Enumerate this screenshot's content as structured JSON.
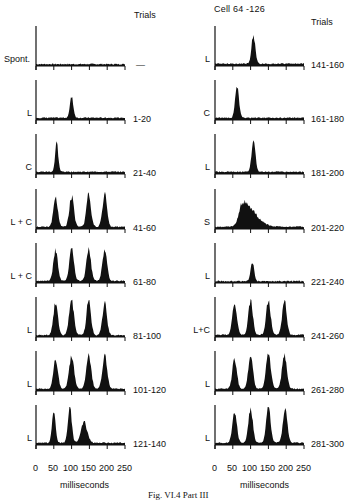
{
  "figure": {
    "title": "Cell 64 -126",
    "trials_header": "Trials",
    "xlabel": "milliseconds",
    "x_ticks": [
      "0",
      "50",
      "100",
      "150",
      "200",
      "250"
    ],
    "caption": "Fig. VI.4  Part III"
  },
  "chart_data": {
    "type": "histogram",
    "title": "Cell 64 -126",
    "xlabel": "milliseconds",
    "ylabel": "",
    "xlim": [
      0,
      250
    ],
    "x_ticks": [
      0,
      50,
      100,
      150,
      200,
      250
    ],
    "column_header": "Trials",
    "panels": [
      {
        "column": "left",
        "condition": "Spont.",
        "trials": "—",
        "peaks": [],
        "baseline": 0.05
      },
      {
        "column": "left",
        "condition": "L",
        "trials": "1-20",
        "peaks": [
          {
            "t": 100,
            "h": 0.55,
            "w": 10
          }
        ],
        "baseline": 0.06
      },
      {
        "column": "left",
        "condition": "C",
        "trials": "21-40",
        "peaks": [
          {
            "t": 58,
            "h": 0.75,
            "w": 9
          }
        ],
        "baseline": 0.06
      },
      {
        "column": "left",
        "condition": "L + C",
        "trials": "41-60",
        "peaks": [
          {
            "t": 55,
            "h": 0.75,
            "w": 13
          },
          {
            "t": 100,
            "h": 0.8,
            "w": 13
          },
          {
            "t": 148,
            "h": 0.85,
            "w": 13
          },
          {
            "t": 193,
            "h": 0.85,
            "w": 13
          }
        ],
        "baseline": 0.06
      },
      {
        "column": "left",
        "condition": "L + C",
        "trials": "61-80",
        "peaks": [
          {
            "t": 55,
            "h": 0.8,
            "w": 13
          },
          {
            "t": 100,
            "h": 0.85,
            "w": 13
          },
          {
            "t": 148,
            "h": 0.85,
            "w": 13
          },
          {
            "t": 193,
            "h": 0.85,
            "w": 13
          }
        ],
        "baseline": 0.06
      },
      {
        "column": "left",
        "condition": "L",
        "trials": "81-100",
        "peaks": [
          {
            "t": 55,
            "h": 0.85,
            "w": 13
          },
          {
            "t": 100,
            "h": 0.9,
            "w": 14
          },
          {
            "t": 148,
            "h": 0.9,
            "w": 13
          },
          {
            "t": 193,
            "h": 0.85,
            "w": 13
          }
        ],
        "baseline": 0.05
      },
      {
        "column": "left",
        "condition": "L",
        "trials": "101-120",
        "peaks": [
          {
            "t": 55,
            "h": 0.8,
            "w": 13
          },
          {
            "t": 100,
            "h": 0.9,
            "w": 14
          },
          {
            "t": 148,
            "h": 0.9,
            "w": 14
          },
          {
            "t": 193,
            "h": 0.85,
            "w": 14
          }
        ],
        "baseline": 0.06
      },
      {
        "column": "left",
        "condition": "L",
        "trials": "121-140",
        "peaks": [
          {
            "t": 50,
            "h": 0.85,
            "w": 10
          },
          {
            "t": 95,
            "h": 0.95,
            "w": 11
          },
          {
            "t": 135,
            "h": 0.55,
            "w": 18
          }
        ],
        "baseline": 0.06
      },
      {
        "column": "right",
        "condition": "L",
        "trials": "141-160",
        "peaks": [
          {
            "t": 108,
            "h": 0.75,
            "w": 11
          }
        ],
        "baseline": 0.06
      },
      {
        "column": "right",
        "condition": "C",
        "trials": "161-180",
        "peaks": [
          {
            "t": 62,
            "h": 0.85,
            "w": 11
          }
        ],
        "baseline": 0.06
      },
      {
        "column": "right",
        "condition": "L",
        "trials": "181-200",
        "peaks": [
          {
            "t": 108,
            "h": 0.85,
            "w": 11
          }
        ],
        "baseline": 0.06
      },
      {
        "column": "right",
        "condition": "S",
        "trials": "201-220",
        "peaks": [
          {
            "t": 78,
            "h": 0.65,
            "w": 35,
            "skew": true
          }
        ],
        "baseline": 0.06
      },
      {
        "column": "right",
        "condition": "L",
        "trials": "221-240",
        "peaks": [
          {
            "t": 105,
            "h": 0.5,
            "w": 10
          }
        ],
        "baseline": 0.05
      },
      {
        "column": "right",
        "condition": "L+C",
        "trials": "241-260",
        "peaks": [
          {
            "t": 55,
            "h": 0.85,
            "w": 13
          },
          {
            "t": 100,
            "h": 0.9,
            "w": 13
          },
          {
            "t": 150,
            "h": 0.9,
            "w": 13
          },
          {
            "t": 195,
            "h": 0.9,
            "w": 13
          }
        ],
        "baseline": 0.06
      },
      {
        "column": "right",
        "condition": "L",
        "trials": "261-280",
        "peaks": [
          {
            "t": 55,
            "h": 0.8,
            "w": 13
          },
          {
            "t": 100,
            "h": 0.9,
            "w": 13
          },
          {
            "t": 150,
            "h": 0.9,
            "w": 14
          },
          {
            "t": 195,
            "h": 0.9,
            "w": 14
          }
        ],
        "baseline": 0.06
      },
      {
        "column": "right",
        "condition": "L",
        "trials": "281-300",
        "peaks": [
          {
            "t": 55,
            "h": 0.8,
            "w": 13
          },
          {
            "t": 100,
            "h": 0.9,
            "w": 13
          },
          {
            "t": 150,
            "h": 0.95,
            "w": 13
          },
          {
            "t": 197,
            "h": 0.9,
            "w": 13
          }
        ],
        "baseline": 0.06
      }
    ]
  }
}
